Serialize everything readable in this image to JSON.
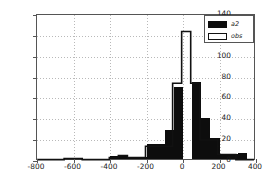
{
  "chart_data": {
    "type": "bar",
    "title": "",
    "xlabel": "",
    "ylabel": "",
    "xlim": [
      -800,
      400
    ],
    "ylim": [
      0,
      140
    ],
    "bin_width": 50,
    "grid": true,
    "legend_position": "top-right",
    "xticks": [
      -800,
      -600,
      -400,
      -200,
      0,
      200,
      400
    ],
    "yticks": [
      0,
      20,
      40,
      60,
      80,
      100,
      120,
      140
    ],
    "series": [
      {
        "name": "a2",
        "style": "filled-bar",
        "color": "#0d0d0d",
        "bin_starts": [
          -800,
          -750,
          -700,
          -650,
          -600,
          -550,
          -500,
          -450,
          -400,
          -350,
          -300,
          -250,
          -200,
          -150,
          -100,
          -50,
          0,
          50,
          100,
          150,
          200,
          250,
          300,
          350
        ],
        "values": [
          0,
          0,
          0,
          1,
          1,
          0,
          0,
          0,
          3,
          3,
          1,
          2,
          14,
          14,
          28,
          69,
          0,
          74,
          39,
          20,
          5,
          5,
          6,
          0
        ]
      },
      {
        "name": "obs",
        "style": "step-outline",
        "color": "#111111",
        "bin_starts": [
          -800,
          -750,
          -700,
          -650,
          -600,
          -550,
          -500,
          -450,
          -400,
          -350,
          -300,
          -250,
          -200,
          -150,
          -100,
          -50,
          0,
          50,
          100,
          150,
          200,
          250,
          300,
          350
        ],
        "values": [
          0,
          0,
          0,
          1,
          1,
          0,
          0,
          0,
          2,
          4,
          2,
          2,
          13,
          13,
          13,
          74,
          124,
          74,
          19,
          19,
          5,
          5,
          0,
          0
        ]
      }
    ]
  },
  "legend": {
    "entries": [
      {
        "label": "a2",
        "swatch": "filled-swatch"
      },
      {
        "label": "obs",
        "swatch": "outline-swatch"
      }
    ]
  },
  "axes": {
    "x_tick_labels": [
      "-800",
      "-600",
      "-400",
      "-200",
      "0",
      "200",
      "400"
    ],
    "y_tick_labels": [
      "0",
      "20",
      "40",
      "60",
      "80",
      "100",
      "120",
      "140"
    ]
  }
}
